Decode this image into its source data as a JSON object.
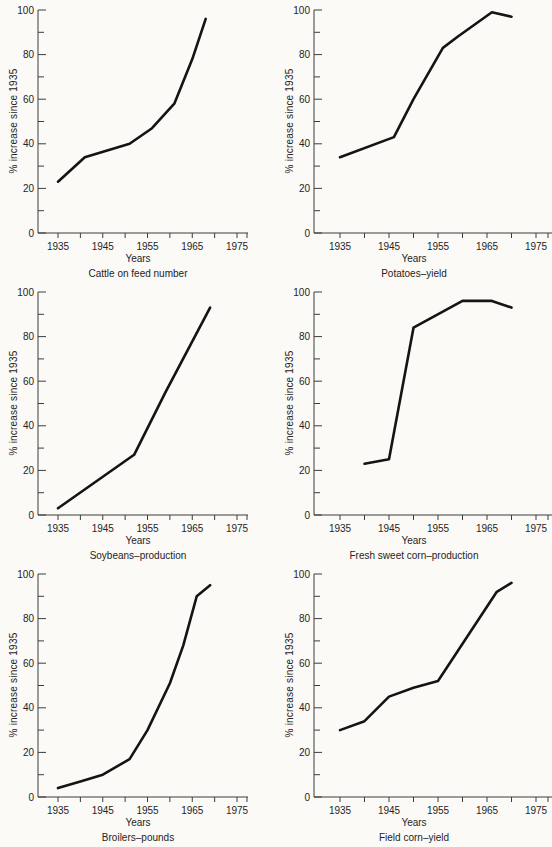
{
  "page": {
    "colors": {
      "background": "#fbfaf7",
      "line": "#141414",
      "axis": "#3c3c3c",
      "text": "#242424"
    }
  },
  "chart_data": [
    {
      "type": "line",
      "title": "Cattle on feed number",
      "xlabel": "Years",
      "ylabel": "% increase since 1935",
      "xlim": [
        1931,
        1978
      ],
      "ylim": [
        0,
        100
      ],
      "x_ticks_labeled": [
        1935,
        1945,
        1955,
        1965,
        1975
      ],
      "x_ticks_minor": [
        1940,
        1950,
        1960,
        1970
      ],
      "y_ticks_labeled": [
        0,
        20,
        40,
        60,
        80,
        100
      ],
      "y_ticks_minor": [
        10,
        30,
        50,
        70,
        90
      ],
      "grid": false,
      "legend": null,
      "series": [
        {
          "name": "Cattle on feed number",
          "points": [
            [
              1935,
              23
            ],
            [
              1941,
              34
            ],
            [
              1946,
              37
            ],
            [
              1951,
              40
            ],
            [
              1956,
              47
            ],
            [
              1961,
              58
            ],
            [
              1965,
              78
            ],
            [
              1968,
              96
            ]
          ]
        }
      ]
    },
    {
      "type": "line",
      "title": "Potatoes–yield",
      "xlabel": "Years",
      "ylabel": "% increase since 1935",
      "xlim": [
        1931,
        1979
      ],
      "ylim": [
        0,
        100
      ],
      "x_ticks_labeled": [
        1935,
        1945,
        1955,
        1965,
        1975
      ],
      "x_ticks_minor": [
        1940,
        1950,
        1960,
        1970
      ],
      "y_ticks_labeled": [
        0,
        20,
        40,
        60,
        80,
        100
      ],
      "y_ticks_minor": [
        10,
        30,
        50,
        70,
        90
      ],
      "grid": false,
      "legend": null,
      "series": [
        {
          "name": "Potatoes–yield",
          "points": [
            [
              1935,
              34
            ],
            [
              1946,
              43
            ],
            [
              1950,
              60
            ],
            [
              1956,
              83
            ],
            [
              1959,
              88
            ],
            [
              1966,
              99
            ],
            [
              1970,
              97
            ]
          ]
        }
      ]
    },
    {
      "type": "line",
      "title": "Soybeans–production",
      "xlabel": "Years",
      "ylabel": "% increase since 1935",
      "xlim": [
        1931,
        1978
      ],
      "ylim": [
        0,
        100
      ],
      "x_ticks_labeled": [
        1935,
        1945,
        1955,
        1965,
        1975
      ],
      "x_ticks_minor": [
        1940,
        1950,
        1960,
        1970
      ],
      "y_ticks_labeled": [
        0,
        20,
        40,
        60,
        80,
        100
      ],
      "y_ticks_minor": [
        10,
        30,
        50,
        70,
        90
      ],
      "grid": false,
      "legend": null,
      "series": [
        {
          "name": "Soybeans–production",
          "points": [
            [
              1935,
              3
            ],
            [
              1952,
              27
            ],
            [
              1959,
              55
            ],
            [
              1969,
              93
            ]
          ]
        }
      ]
    },
    {
      "type": "line",
      "title": "Fresh sweet corn–production",
      "xlabel": "Years",
      "ylabel": "% increase since 1935",
      "xlim": [
        1931,
        1979
      ],
      "ylim": [
        0,
        100
      ],
      "x_ticks_labeled": [
        1935,
        1945,
        1955,
        1965,
        1975
      ],
      "x_ticks_minor": [
        1940,
        1950,
        1960,
        1970
      ],
      "y_ticks_labeled": [
        0,
        20,
        40,
        60,
        80,
        100
      ],
      "y_ticks_minor": [
        10,
        30,
        50,
        70,
        90
      ],
      "grid": false,
      "legend": null,
      "series": [
        {
          "name": "Fresh sweet corn–production",
          "points": [
            [
              1940,
              23
            ],
            [
              1945,
              25
            ],
            [
              1950,
              84
            ],
            [
              1960,
              96
            ],
            [
              1966,
              96
            ],
            [
              1970,
              93
            ]
          ]
        }
      ]
    },
    {
      "type": "line",
      "title": "Broilers–pounds",
      "xlabel": "Years",
      "ylabel": "% increase since 1935",
      "xlim": [
        1931,
        1978
      ],
      "ylim": [
        0,
        100
      ],
      "x_ticks_labeled": [
        1935,
        1945,
        1955,
        1965,
        1975
      ],
      "x_ticks_minor": [
        1940,
        1950,
        1960,
        1970
      ],
      "y_ticks_labeled": [
        0,
        20,
        40,
        60,
        80,
        100
      ],
      "y_ticks_minor": [
        10,
        30,
        50,
        70,
        90
      ],
      "grid": false,
      "legend": null,
      "series": [
        {
          "name": "Broilers–pounds",
          "points": [
            [
              1935,
              4
            ],
            [
              1940,
              7
            ],
            [
              1945,
              10
            ],
            [
              1951,
              17
            ],
            [
              1955,
              30
            ],
            [
              1960,
              51
            ],
            [
              1963,
              68
            ],
            [
              1966,
              90
            ],
            [
              1969,
              95
            ]
          ]
        }
      ]
    },
    {
      "type": "line",
      "title": "Field corn–yield",
      "xlabel": "Years",
      "ylabel": "% increase since 1935",
      "xlim": [
        1931,
        1979
      ],
      "ylim": [
        0,
        100
      ],
      "x_ticks_labeled": [
        1935,
        1945,
        1955,
        1965,
        1975
      ],
      "x_ticks_minor": [
        1940,
        1950,
        1960,
        1970
      ],
      "y_ticks_labeled": [
        0,
        20,
        40,
        60,
        80,
        100
      ],
      "y_ticks_minor": [
        10,
        30,
        50,
        70,
        90
      ],
      "grid": false,
      "legend": null,
      "series": [
        {
          "name": "Field corn–yield",
          "points": [
            [
              1935,
              30
            ],
            [
              1940,
              34
            ],
            [
              1945,
              45
            ],
            [
              1950,
              49
            ],
            [
              1955,
              52
            ],
            [
              1967,
              92
            ],
            [
              1970,
              96
            ]
          ]
        }
      ]
    }
  ]
}
